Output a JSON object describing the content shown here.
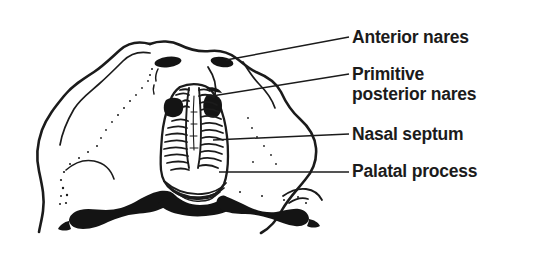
{
  "figure": {
    "background_color": "#ffffff",
    "ink_color": "#1b1b1b",
    "width": 542,
    "height": 263
  },
  "labels": [
    {
      "id": "anterior-nares",
      "text": "Anterior nares",
      "leader": "diagonal line from label to right anterior naris"
    },
    {
      "id": "primitive-posterior-nares",
      "text": "Primitive\nposterior nares",
      "leader": "diagonal line from label to upper nasal chamber"
    },
    {
      "id": "nasal-septum",
      "text": "Nasal septum",
      "leader": "horizontal line from label to midline septum"
    },
    {
      "id": "palatal-process",
      "text": "Palatal process",
      "leader": "horizontal line from label to right palatal shelf"
    }
  ],
  "structures": {
    "outline": "rounded lobed head/face outline occupying left two-thirds",
    "anterior_nares": "two solid dark oval nostrils at upper midline",
    "nasal_chambers": "paired vertically oriented chambers with horizontal hatched turbinate ridges",
    "nasal_septum": "vertical midline band separating the two nasal chambers",
    "palatal_processes": "dark irregular horizontal shelves flanking the midline at the lower margin",
    "shading": "stippled dotted shading along the left cheek region"
  }
}
